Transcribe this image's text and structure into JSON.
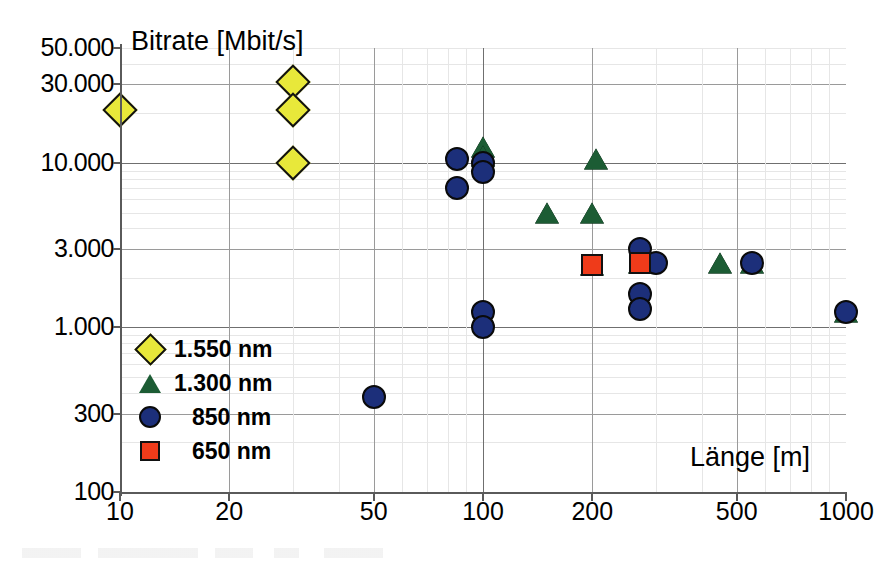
{
  "chart_data": {
    "type": "scatter",
    "title": "",
    "xlabel": "Länge [m]",
    "ylabel": "Bitrate [Mbit/s]",
    "xscale": "log",
    "yscale": "log",
    "xlim": [
      10,
      1000
    ],
    "ylim": [
      100,
      50000
    ],
    "grid": true,
    "legend_position": "inside-lower-left",
    "x_ticks": [
      "10",
      "20",
      "50",
      "100",
      "200",
      "500",
      "1000"
    ],
    "x_tick_values": [
      10,
      20,
      50,
      100,
      200,
      500,
      1000
    ],
    "y_ticks": [
      "100",
      "300",
      "1.000",
      "3.000",
      "10.000",
      "30.000",
      "50.000"
    ],
    "y_tick_values": [
      100,
      300,
      1000,
      3000,
      10000,
      30000,
      50000
    ],
    "y_unit_note": "values shown in kbit/s notation on axis; 1.000 = 1000",
    "series": [
      {
        "name": "1.550 nm",
        "marker": "diamond",
        "color": "#e8e83a",
        "edge": "#111111",
        "points": [
          {
            "x": 10,
            "y": 21000
          },
          {
            "x": 30,
            "y": 31000
          },
          {
            "x": 30,
            "y": 21000
          },
          {
            "x": 30,
            "y": 10000
          }
        ]
      },
      {
        "name": "1.300 nm",
        "marker": "triangle",
        "color": "#1c5c34",
        "edge": "#0a0a0a",
        "points": [
          {
            "x": 100,
            "y": 12500
          },
          {
            "x": 100,
            "y": 11000
          },
          {
            "x": 205,
            "y": 10500
          },
          {
            "x": 150,
            "y": 5000
          },
          {
            "x": 200,
            "y": 5000
          },
          {
            "x": 200,
            "y": 2400
          },
          {
            "x": 270,
            "y": 2450
          },
          {
            "x": 450,
            "y": 2450
          },
          {
            "x": 550,
            "y": 2450
          },
          {
            "x": 1000,
            "y": 1250
          }
        ]
      },
      {
        "name": "850 nm",
        "marker": "circle",
        "color": "#1c2f7a",
        "edge": "#0a0a0a",
        "points": [
          {
            "x": 50,
            "y": 380
          },
          {
            "x": 85,
            "y": 10500
          },
          {
            "x": 85,
            "y": 7000
          },
          {
            "x": 100,
            "y": 10000
          },
          {
            "x": 100,
            "y": 8800
          },
          {
            "x": 100,
            "y": 1250
          },
          {
            "x": 100,
            "y": 1000
          },
          {
            "x": 270,
            "y": 3000
          },
          {
            "x": 300,
            "y": 2450
          },
          {
            "x": 270,
            "y": 1600
          },
          {
            "x": 270,
            "y": 1300
          },
          {
            "x": 550,
            "y": 2450
          },
          {
            "x": 1000,
            "y": 1250
          }
        ]
      },
      {
        "name": "650 nm",
        "marker": "square",
        "color": "#ef3b1a",
        "edge": "#111111",
        "points": [
          {
            "x": 200,
            "y": 2400
          },
          {
            "x": 270,
            "y": 2450
          }
        ]
      }
    ]
  },
  "legend": {
    "items": [
      {
        "label": "1.550 nm",
        "marker": "diamond-icon"
      },
      {
        "label": "1.300 nm",
        "marker": "triangle-icon"
      },
      {
        "label": "850 nm",
        "marker": "circle-icon"
      },
      {
        "label": "650 nm",
        "marker": "square-icon"
      }
    ]
  },
  "colors": {
    "series_1550": "#e8e83a",
    "series_1300": "#1c5c34",
    "series_850": "#1c2f7a",
    "series_650": "#ef3b1a",
    "axis": "#5a5a5a",
    "grid_minor": "#e6e6e6",
    "grid_major": "#9a9a9a"
  }
}
